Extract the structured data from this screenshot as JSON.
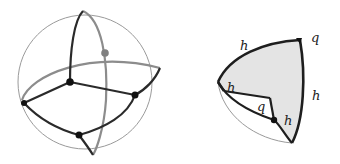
{
  "figure": {
    "left_panel": {
      "description": "Sphere with great circles and four black vertices, one grey vertex",
      "colors": {
        "outline": "#9a9a9a",
        "edge_dark": "#2a2a2a",
        "edge_light": "#8c8c8c",
        "vertex_dark": "#111111",
        "vertex_grey": "#808080"
      }
    },
    "right_panel": {
      "description": "Shaded spherical region with boundary edges labeled",
      "labels": {
        "top_edge": "h",
        "top_right_vertex": "q",
        "right_edge": "h",
        "left_inner": "h",
        "inner_angle": "q",
        "bottom_inner": "h"
      },
      "colors": {
        "fill": "#e4e4e4",
        "edge": "#1e1e1e",
        "outline": "#9a9a9a"
      }
    }
  }
}
